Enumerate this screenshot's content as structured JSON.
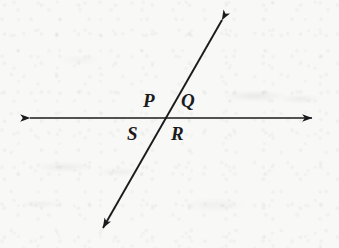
{
  "figure": {
    "canvas": {
      "width": 339,
      "height": 248
    },
    "background_color": "#f8f8f6",
    "ink_color": "#1b1b1d",
    "stroke_width": 1.6
  },
  "lines": [
    {
      "name": "horizontal-line",
      "style": "double-headed-arrow",
      "from": {
        "x": 30,
        "y": 118
      },
      "to": {
        "x": 312,
        "y": 118
      }
    },
    {
      "name": "diagonal-line",
      "style": "double-headed-arrow",
      "from": {
        "x": 222,
        "y": 20
      },
      "to": {
        "x": 103,
        "y": 228
      }
    }
  ],
  "intersection": {
    "x": 163,
    "y": 118
  },
  "labels": [
    {
      "text": "P",
      "region": "upper-left",
      "x": 143,
      "y": 91
    },
    {
      "text": "Q",
      "region": "upper-right",
      "x": 181,
      "y": 91
    },
    {
      "text": "S",
      "region": "lower-left",
      "x": 127,
      "y": 124
    },
    {
      "text": "R",
      "region": "lower-right",
      "x": 171,
      "y": 124
    }
  ]
}
